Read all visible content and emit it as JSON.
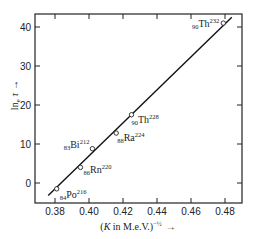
{
  "chart_data": {
    "type": "scatter",
    "title": "",
    "xlabel": "(K in M.e.V.)^-1/2",
    "xlabel_parts": {
      "open": "(",
      "var": "K",
      "mid": " in M.e.V.)",
      "exp": "−½",
      "arrow": "→"
    },
    "ylabel": "ln_e τ",
    "ylabel_parts": {
      "text": "ln",
      "sub": "e",
      "tau": "τ",
      "arrow": "→"
    },
    "xlim": [
      0.37,
      0.49
    ],
    "ylim": [
      -5,
      44
    ],
    "xticks": [
      0.38,
      0.4,
      0.42,
      0.44,
      0.46,
      0.48
    ],
    "xtick_labels": [
      "0.38",
      "0.40",
      "0.42",
      "0.44",
      "0.46",
      "0.48"
    ],
    "yticks": [
      0,
      10,
      20,
      30,
      40
    ],
    "ytick_labels": [
      "0",
      "10",
      "20",
      "30",
      "40"
    ],
    "grid": false,
    "legend": null,
    "fit_line": {
      "x": [
        0.376,
        0.484
      ],
      "y": [
        -3.2,
        42.5
      ]
    },
    "points": [
      {
        "label": "Po",
        "Z": "84",
        "A": "216",
        "x": 0.381,
        "y": -1.5
      },
      {
        "label": "Rn",
        "Z": "86",
        "A": "220",
        "x": 0.395,
        "y": 4.0
      },
      {
        "label": "Bi",
        "Z": "83",
        "A": "212",
        "x": 0.402,
        "y": 8.8
      },
      {
        "label": "Ra",
        "Z": "88",
        "A": "224",
        "x": 0.416,
        "y": 12.8
      },
      {
        "label": "Th",
        "Z": "90",
        "A": "228",
        "x": 0.425,
        "y": 17.5
      },
      {
        "label": "Th",
        "Z": "90",
        "A": "232",
        "x": 0.479,
        "y": 41.0
      }
    ]
  }
}
